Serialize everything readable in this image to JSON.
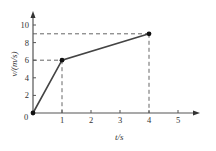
{
  "chart_data": {
    "type": "line",
    "title": "",
    "xlabel": "t/s",
    "ylabel": "v/(m/s)",
    "xlim": [
      0,
      5.5
    ],
    "ylim": [
      0,
      11
    ],
    "grid": false,
    "legend": null,
    "x_ticks": [
      "1",
      "2",
      "3",
      "4",
      "5"
    ],
    "y_ticks": [
      "2",
      "4",
      "6",
      "8",
      "10"
    ],
    "origin_label": "0",
    "series": [
      {
        "name": "v(t)",
        "x": [
          0,
          1,
          4
        ],
        "y": [
          0,
          6,
          9
        ]
      }
    ],
    "marked_points": [
      {
        "x": 0,
        "y": 0
      },
      {
        "x": 1,
        "y": 6
      },
      {
        "x": 4,
        "y": 9
      }
    ],
    "dashed_guides": [
      {
        "point": [
          1,
          6
        ]
      },
      {
        "point": [
          4,
          9
        ]
      }
    ],
    "colors": {
      "line": "#444444",
      "axis": "#555555",
      "guide": "#555555",
      "text": "#333333"
    }
  }
}
